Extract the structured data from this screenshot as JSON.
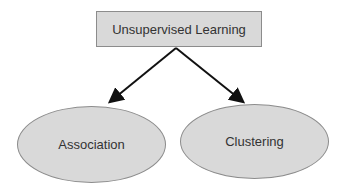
{
  "diagram": {
    "root": {
      "label": "Unsupervised Learning"
    },
    "children": [
      {
        "label": "Association"
      },
      {
        "label": "Clustering"
      }
    ]
  }
}
